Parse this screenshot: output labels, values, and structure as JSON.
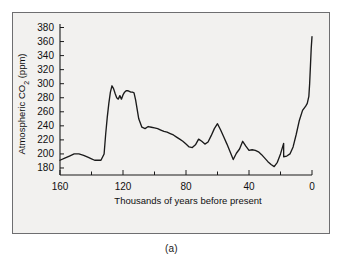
{
  "figure": {
    "caption": "(a)",
    "background_color": "#f2f1ef",
    "line_color": "#1b1b1b",
    "frame_color": "#6e6e70"
  },
  "chart_data": {
    "type": "line",
    "title": "",
    "xlabel": "Thousands of years before present",
    "ylabel": "Atmospheric CO2 (ppm)",
    "ylabel_parts": {
      "prefix": "Atmospheric CO",
      "subscript": "2",
      "suffix": " (ppm)"
    },
    "xlim": [
      160,
      0
    ],
    "ylim": [
      170,
      385
    ],
    "x_reversed": true,
    "grid": false,
    "legend": "none",
    "xticks": [
      160,
      120,
      80,
      40,
      0
    ],
    "xtick_labels": [
      "160",
      "120",
      "80",
      "40",
      "0"
    ],
    "x_minor_ticks": [
      140,
      100,
      60,
      20
    ],
    "yticks": [
      180,
      200,
      220,
      240,
      260,
      280,
      300,
      320,
      340,
      360,
      380
    ],
    "ytick_labels": [
      "180",
      "200",
      "220",
      "240",
      "260",
      "280",
      "300",
      "320",
      "340",
      "360",
      "380"
    ],
    "series": [
      {
        "name": "Atmospheric CO2",
        "x": [
          160,
          157,
          154,
          151,
          148,
          145,
          142,
          140,
          138,
          136,
          134,
          132,
          131,
          130,
          129,
          128,
          127,
          126,
          125,
          124,
          123,
          122,
          121,
          120,
          119,
          118,
          117,
          116,
          115,
          114,
          113,
          112,
          110,
          108,
          106,
          104,
          102,
          100,
          98,
          96,
          94,
          92,
          90,
          88,
          86,
          84,
          82,
          80,
          78,
          76,
          74,
          72,
          70,
          68,
          66,
          64,
          62,
          60,
          58,
          56,
          54,
          52,
          50,
          48,
          46,
          44,
          42,
          40,
          38,
          36,
          34,
          32,
          30,
          28,
          26,
          24,
          22,
          20,
          18,
          16,
          14,
          12,
          10,
          8,
          6,
          4,
          2,
          1,
          0
        ],
        "y": [
          191,
          194,
          197,
          200,
          200,
          198,
          195,
          193,
          191,
          191,
          191,
          200,
          228,
          252,
          272,
          288,
          297,
          293,
          286,
          280,
          278,
          283,
          278,
          284,
          288,
          290,
          290,
          289,
          288,
          288,
          287,
          277,
          250,
          238,
          236,
          239,
          238,
          237,
          236,
          234,
          232,
          231,
          229,
          227,
          224,
          221,
          218,
          214,
          210,
          209,
          213,
          221,
          218,
          214,
          217,
          226,
          236,
          243,
          234,
          224,
          214,
          203,
          192,
          201,
          207,
          218,
          211,
          205,
          206,
          205,
          203,
          199,
          194,
          189,
          185,
          182,
          188,
          200,
          215,
          230,
          224,
          213,
          205,
          203,
          204,
          202,
          197,
          196,
          196
        ]
      },
      {
        "name": "Modern rise",
        "x": [
          18,
          16,
          14,
          12,
          10,
          8,
          6,
          4,
          3,
          2,
          1.5,
          1,
          0.5,
          0
        ],
        "y": [
          196,
          197,
          200,
          210,
          228,
          248,
          262,
          268,
          272,
          282,
          300,
          325,
          350,
          367
        ]
      }
    ],
    "notes": {
      "peak_interglacial_ppm": 297,
      "modern_max_ppm": 367,
      "glacial_minimum_ppm": 182
    }
  }
}
